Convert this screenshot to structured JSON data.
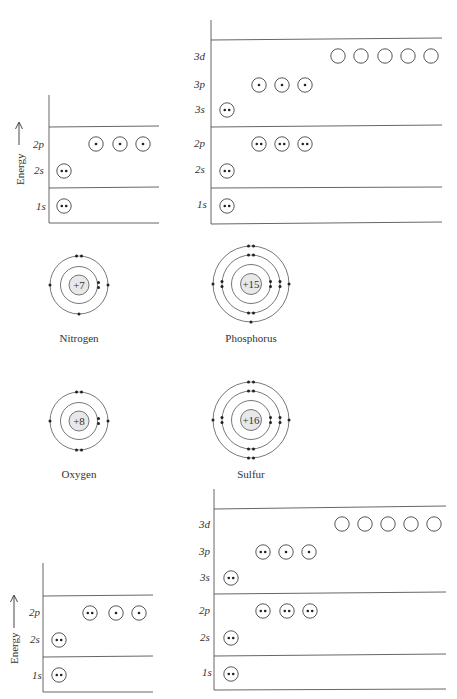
{
  "energy_label": "Energy",
  "diagrams": {
    "nitrogen_levels": {
      "levels": [
        {
          "label": "1s",
          "orbitals": [
            2
          ]
        },
        {
          "label": "2s",
          "orbitals": [
            2
          ]
        },
        {
          "label": "2p",
          "orbitals": [
            1,
            1,
            1
          ]
        }
      ]
    },
    "phosphorus_levels": {
      "levels": [
        {
          "label": "1s",
          "orbitals": [
            2
          ]
        },
        {
          "label": "2s",
          "orbitals": [
            2
          ]
        },
        {
          "label": "2p",
          "orbitals": [
            2,
            2,
            2
          ]
        },
        {
          "label": "3s",
          "orbitals": [
            2
          ]
        },
        {
          "label": "3p",
          "orbitals": [
            1,
            1,
            1
          ]
        },
        {
          "label": "3d",
          "orbitals": [
            0,
            0,
            0,
            0,
            0
          ]
        }
      ]
    },
    "oxygen_levels": {
      "levels": [
        {
          "label": "1s",
          "orbitals": [
            2
          ]
        },
        {
          "label": "2s",
          "orbitals": [
            2
          ]
        },
        {
          "label": "2p",
          "orbitals": [
            2,
            1,
            1
          ]
        }
      ]
    },
    "sulfur_levels": {
      "levels": [
        {
          "label": "1s",
          "orbitals": [
            2
          ]
        },
        {
          "label": "2s",
          "orbitals": [
            2
          ]
        },
        {
          "label": "2p",
          "orbitals": [
            2,
            2,
            2
          ]
        },
        {
          "label": "3s",
          "orbitals": [
            2
          ]
        },
        {
          "label": "3p",
          "orbitals": [
            2,
            1,
            1
          ]
        },
        {
          "label": "3d",
          "orbitals": [
            0,
            0,
            0,
            0,
            0
          ]
        }
      ]
    }
  },
  "atoms": {
    "nitrogen": {
      "name": "Nitrogen",
      "charge": "+7",
      "shells": [
        2,
        5
      ]
    },
    "phosphorus": {
      "name": "Phosphorus",
      "charge": "+15",
      "shells": [
        2,
        8,
        5
      ]
    },
    "oxygen": {
      "name": "Oxygen",
      "charge": "+8",
      "shells": [
        2,
        6
      ]
    },
    "sulfur": {
      "name": "Sulfur",
      "charge": "+16",
      "shells": [
        2,
        8,
        6
      ]
    }
  },
  "labels": {
    "n_1s": "1s",
    "n_2s": "2s",
    "n_2p": "2p",
    "p_1s": "1s",
    "p_2s": "2s",
    "p_2p": "2p",
    "p_3s": "3s",
    "p_3p": "3p",
    "p_3d": "3d",
    "o_1s": "1s",
    "o_2s": "2s",
    "o_2p": "2p",
    "s_1s": "1s",
    "s_2s": "2s",
    "s_2p": "2p",
    "s_3s": "3s",
    "s_3p": "3p",
    "s_3d": "3d"
  }
}
